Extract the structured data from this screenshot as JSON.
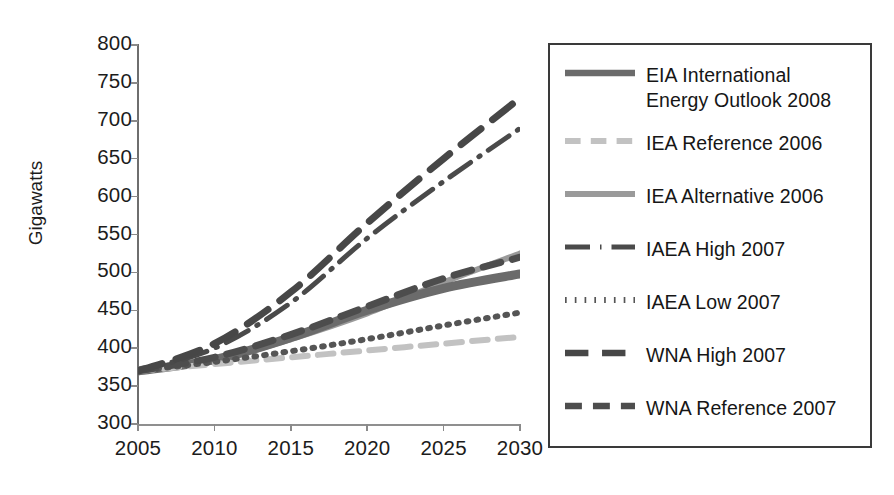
{
  "chart_data": {
    "type": "line",
    "title": "",
    "xlabel": "",
    "ylabel": "Gigawatts",
    "xlim": [
      2005,
      2030
    ],
    "ylim": [
      300,
      800
    ],
    "yticks": [
      300,
      350,
      400,
      450,
      500,
      550,
      600,
      650,
      700,
      750,
      800
    ],
    "xticks": [
      2005,
      2010,
      2015,
      2020,
      2025,
      2030
    ],
    "grid": false,
    "legend_position": "right",
    "x": [
      2005,
      2010,
      2015,
      2020,
      2025,
      2030
    ],
    "series": [
      {
        "name": "EIA International\nEnergy Outlook 2008",
        "legend_label": "EIA International Energy Outlook 2008",
        "style": "solid",
        "color": "#6b6b6b",
        "width": 9,
        "values": [
          370,
          385,
          414,
          450,
          479,
          498
        ]
      },
      {
        "name": "IEA Reference 2006",
        "legend_label": "IEA Reference 2006",
        "style": "dashed",
        "color": "#c2c2c2",
        "width": 6,
        "values": [
          370,
          379,
          388,
          397,
          406,
          415
        ]
      },
      {
        "name": "IEA Alternative 2006",
        "legend_label": "IEA Alternative 2006",
        "style": "solid",
        "color": "#9a9a9a",
        "width": 6,
        "values": [
          370,
          383,
          412,
          446,
          487,
          525
        ]
      },
      {
        "name": "IAEA High 2007",
        "legend_label": "IAEA High 2007",
        "style": "dashdot",
        "color": "#4a4a4a",
        "width": 5,
        "values": [
          370,
          400,
          460,
          545,
          620,
          690
        ]
      },
      {
        "name": "IAEA Low 2007",
        "legend_label": "IAEA Low 2007",
        "style": "dotted",
        "color": "#555555",
        "width": 6,
        "values": [
          370,
          382,
          396,
          412,
          430,
          447
        ]
      },
      {
        "name": "WNA High 2007",
        "legend_label": "WNA High 2007",
        "style": "longdash",
        "color": "#474747",
        "width": 7,
        "values": [
          370,
          406,
          474,
          565,
          650,
          730
        ]
      },
      {
        "name": "WNA Reference 2007",
        "legend_label": "WNA Reference 2007",
        "style": "dashed",
        "color": "#4d4d4d",
        "width": 7,
        "values": [
          370,
          388,
          418,
          455,
          492,
          520
        ]
      }
    ]
  },
  "axis": {
    "y_title": "Gigawatts",
    "y_tick_labels": [
      "800",
      "750",
      "700",
      "650",
      "600",
      "550",
      "500",
      "450",
      "400",
      "350",
      "300"
    ],
    "x_tick_labels": [
      "2005",
      "2010",
      "2015",
      "2020",
      "2025",
      "2030"
    ]
  },
  "legend": {
    "items": [
      {
        "label": "EIA International\nEnergy Outlook 2008"
      },
      {
        "label": "IEA Reference 2006"
      },
      {
        "label": "IEA Alternative 2006"
      },
      {
        "label": "IAEA High 2007"
      },
      {
        "label": "IAEA Low 2007"
      },
      {
        "label": "WNA High 2007"
      },
      {
        "label": "WNA Reference 2007"
      }
    ]
  },
  "colors": {
    "axis": "#8a8a8a",
    "text": "#1c1c1c",
    "legend_border": "#3a3a3a",
    "background": "#ffffff"
  }
}
